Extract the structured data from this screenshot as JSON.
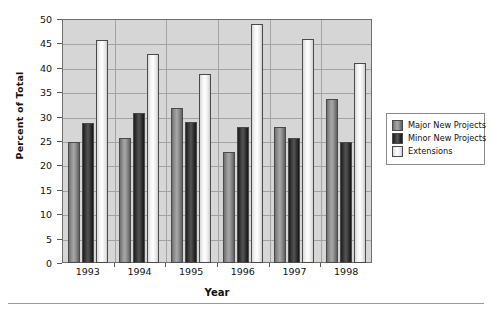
{
  "chart_data": {
    "type": "bar",
    "title": "",
    "subtitle": "",
    "xlabel": "Year",
    "ylabel": "Percent of Total",
    "categories": [
      "1993",
      "1994",
      "1995",
      "1996",
      "1997",
      "1998"
    ],
    "series": [
      {
        "name": "Major New Projects",
        "color": "#8e8e8e",
        "values": [
          24.7,
          25.7,
          31.7,
          22.8,
          27.9,
          33.6
        ]
      },
      {
        "name": "Minor New Projects",
        "color": "#2b2b2b",
        "values": [
          28.7,
          30.7,
          28.8,
          27.8,
          25.7,
          24.9
        ]
      },
      {
        "name": "Extensions",
        "color": "#f4f4f4",
        "values": [
          45.8,
          42.9,
          38.7,
          48.9,
          45.9,
          41.0
        ]
      }
    ],
    "ylim": [
      0,
      50
    ],
    "ytick_step": 5,
    "ytick_labels": [
      "0",
      "5",
      "10",
      "15",
      "20",
      "25",
      "30",
      "35",
      "40",
      "45",
      "50"
    ],
    "grid": "horizontal",
    "legend_position": "right",
    "plot_background": "#d6d6d6",
    "annotations": []
  },
  "legend": {
    "items": [
      {
        "label": "Major New Projects"
      },
      {
        "label": "Minor New Projects"
      },
      {
        "label": "Extensions"
      }
    ]
  },
  "axes": {
    "y_title": "Percent of Total",
    "x_title": "Year"
  }
}
